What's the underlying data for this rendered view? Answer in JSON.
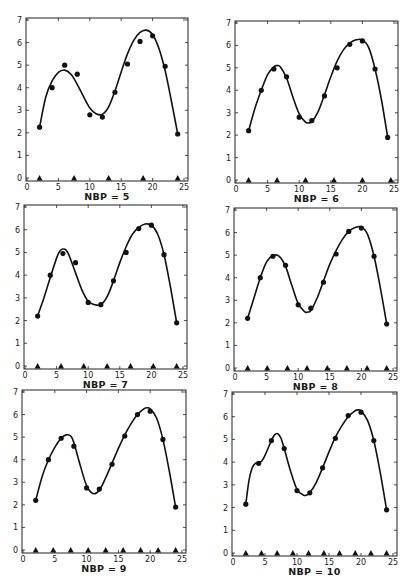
{
  "figure": {
    "background": "#ffffff",
    "ink": "#111111"
  },
  "chart_data": [
    {
      "type": "scatter",
      "title": "NBP = 5",
      "xlabel": "",
      "ylabel": "",
      "xlim": [
        0,
        25
      ],
      "ylim": [
        0,
        7
      ],
      "xticks": [
        0,
        5,
        10,
        15,
        20,
        25
      ],
      "yticks": [
        0,
        1,
        2,
        3,
        4,
        5,
        6,
        7
      ],
      "grid": false,
      "points": {
        "x": [
          2,
          4,
          6,
          8,
          10,
          12,
          14,
          16,
          18,
          20,
          22,
          24
        ],
        "y": [
          2.25,
          4.0,
          5.0,
          4.6,
          2.8,
          2.7,
          3.8,
          5.05,
          6.05,
          6.3,
          4.95,
          1.95
        ]
      },
      "fit_curve": {
        "x": [
          2,
          3,
          4,
          5,
          6,
          7,
          8,
          9,
          10,
          11,
          12,
          13,
          14,
          15,
          16,
          17,
          18,
          19,
          20,
          21,
          22,
          23,
          24
        ],
        "y": [
          2.25,
          3.6,
          4.3,
          4.68,
          4.78,
          4.6,
          4.15,
          3.6,
          3.1,
          2.85,
          2.82,
          3.15,
          3.85,
          4.7,
          5.5,
          6.1,
          6.45,
          6.55,
          6.35,
          5.75,
          4.75,
          3.4,
          1.95
        ]
      },
      "breakpoints_x": [
        2,
        7.5,
        13,
        18.5,
        24
      ]
    },
    {
      "type": "scatter",
      "title": "NBP = 6",
      "xlabel": "",
      "ylabel": "",
      "xlim": [
        0,
        25
      ],
      "ylim": [
        0,
        7
      ],
      "xticks": [
        0,
        5,
        10,
        15,
        20,
        25
      ],
      "yticks": [
        0,
        1,
        2,
        3,
        4,
        5,
        6,
        7
      ],
      "grid": false,
      "points": {
        "x": [
          2,
          4,
          6,
          8,
          10,
          12,
          14,
          16,
          18,
          20,
          22,
          24
        ],
        "y": [
          2.2,
          4.0,
          4.95,
          4.6,
          2.8,
          2.65,
          3.75,
          5.0,
          6.05,
          6.2,
          4.95,
          1.9
        ]
      },
      "fit_curve": {
        "x": [
          2,
          3,
          4,
          5,
          6,
          6.5,
          7,
          8,
          9,
          10,
          11,
          11.5,
          12,
          13,
          14,
          15,
          16,
          17,
          18,
          19,
          20,
          21,
          22,
          23,
          24
        ],
        "y": [
          2.2,
          3.2,
          4.0,
          4.7,
          5.05,
          5.1,
          5.05,
          4.55,
          3.7,
          2.95,
          2.58,
          2.55,
          2.6,
          3.05,
          3.8,
          4.6,
          5.3,
          5.8,
          6.1,
          6.25,
          6.25,
          5.9,
          4.95,
          3.6,
          1.9
        ]
      },
      "breakpoints_x": [
        2,
        6.5,
        11,
        15.5,
        20,
        24.5
      ]
    },
    {
      "type": "scatter",
      "title": "NBP = 7",
      "xlabel": "",
      "ylabel": "",
      "xlim": [
        0,
        25
      ],
      "ylim": [
        0,
        7
      ],
      "xticks": [
        0,
        5,
        10,
        15,
        20,
        25
      ],
      "yticks": [
        0,
        1,
        2,
        3,
        4,
        5,
        6,
        7
      ],
      "grid": false,
      "points": {
        "x": [
          2,
          4,
          6,
          8,
          10,
          12,
          14,
          16,
          18,
          20,
          22,
          24
        ],
        "y": [
          2.2,
          4.0,
          4.95,
          4.55,
          2.8,
          2.7,
          3.75,
          5.0,
          6.05,
          6.2,
          4.9,
          1.9
        ]
      },
      "fit_curve": {
        "x": [
          2,
          3,
          4,
          5,
          5.5,
          6,
          6.5,
          7,
          8,
          9,
          10,
          11,
          12,
          13,
          14,
          15,
          16,
          17,
          18,
          19,
          20,
          21,
          22,
          23,
          24
        ],
        "y": [
          2.2,
          3.0,
          3.9,
          4.75,
          5.05,
          5.15,
          5.1,
          4.85,
          4.1,
          3.35,
          2.85,
          2.7,
          2.7,
          3.05,
          3.75,
          4.55,
          5.25,
          5.8,
          6.1,
          6.25,
          6.2,
          5.8,
          4.9,
          3.5,
          1.9
        ]
      },
      "breakpoints_x": [
        2,
        5.7,
        9.3,
        13,
        16.7,
        20.3,
        24
      ]
    },
    {
      "type": "scatter",
      "title": "NBP = 8",
      "xlabel": "",
      "ylabel": "",
      "xlim": [
        0,
        25
      ],
      "ylim": [
        0,
        7
      ],
      "xticks": [
        0,
        5,
        10,
        15,
        20,
        25
      ],
      "yticks": [
        0,
        1,
        2,
        3,
        4,
        5,
        6,
        7
      ],
      "grid": false,
      "points": {
        "x": [
          2,
          4,
          6,
          8,
          10,
          12,
          14,
          16,
          18,
          20,
          22,
          24
        ],
        "y": [
          2.2,
          4.0,
          4.95,
          4.55,
          2.8,
          2.65,
          3.8,
          5.05,
          6.05,
          6.2,
          4.95,
          1.95
        ]
      },
      "fit_curve": {
        "x": [
          2,
          3,
          4,
          5,
          6,
          7,
          8,
          9,
          10,
          11,
          11.5,
          12,
          13,
          14,
          15,
          16,
          17,
          18,
          19,
          20,
          21,
          22,
          23,
          24
        ],
        "y": [
          2.2,
          3.1,
          4.0,
          4.7,
          4.98,
          4.95,
          4.5,
          3.65,
          2.85,
          2.5,
          2.48,
          2.55,
          3.1,
          3.85,
          4.6,
          5.2,
          5.7,
          6.05,
          6.22,
          6.25,
          5.9,
          4.95,
          3.55,
          1.95
        ]
      },
      "breakpoints_x": [
        2,
        5.1,
        8.3,
        11.4,
        14.6,
        17.7,
        20.9,
        24
      ]
    },
    {
      "type": "scatter",
      "title": "NBP = 9",
      "xlabel": "",
      "ylabel": "",
      "xlim": [
        0,
        25
      ],
      "ylim": [
        0,
        7
      ],
      "xticks": [
        0,
        5,
        10,
        15,
        20,
        25
      ],
      "yticks": [
        0,
        1,
        2,
        3,
        4,
        5,
        6,
        7
      ],
      "grid": false,
      "points": {
        "x": [
          2,
          4,
          6,
          8,
          10,
          12,
          14,
          16,
          18,
          20,
          22,
          24
        ],
        "y": [
          2.2,
          4.0,
          4.95,
          4.6,
          2.75,
          2.7,
          3.8,
          5.05,
          6.0,
          6.15,
          4.9,
          1.9
        ]
      },
      "fit_curve": {
        "x": [
          2,
          3,
          4,
          5,
          6,
          6.8,
          7.5,
          8,
          9,
          10,
          11,
          12,
          13,
          14,
          15,
          16,
          17,
          18,
          19,
          19.5,
          20,
          21,
          22,
          23,
          24
        ],
        "y": [
          2.2,
          3.25,
          4.0,
          4.55,
          4.95,
          5.1,
          5.05,
          4.75,
          3.75,
          2.85,
          2.5,
          2.65,
          3.2,
          3.85,
          4.5,
          5.1,
          5.6,
          6.0,
          6.25,
          6.3,
          6.25,
          5.85,
          4.9,
          3.5,
          1.9
        ]
      },
      "breakpoints_x": [
        2,
        4.75,
        7.5,
        10.25,
        13,
        15.75,
        18.5,
        21.25,
        24
      ]
    },
    {
      "type": "scatter",
      "title": "NBP = 10",
      "xlabel": "",
      "ylabel": "",
      "xlim": [
        0,
        25
      ],
      "ylim": [
        0,
        7
      ],
      "xticks": [
        0,
        5,
        10,
        15,
        20,
        25
      ],
      "yticks": [
        0,
        1,
        2,
        3,
        4,
        5,
        6,
        7
      ],
      "grid": false,
      "points": {
        "x": [
          2,
          4,
          6,
          8,
          10,
          12,
          14,
          16,
          18,
          20,
          22,
          24
        ],
        "y": [
          2.15,
          3.95,
          4.95,
          4.6,
          2.75,
          2.65,
          3.75,
          5.05,
          6.05,
          6.2,
          4.95,
          1.9
        ]
      },
      "fit_curve": {
        "x": [
          2,
          2.5,
          3,
          3.5,
          4,
          4.5,
          5,
          6,
          6.5,
          7,
          7.5,
          8,
          9,
          10,
          11,
          11.5,
          12,
          13,
          14,
          15,
          16,
          17,
          18,
          19,
          19.5,
          20,
          21,
          22,
          23,
          24
        ],
        "y": [
          2.15,
          3.2,
          3.75,
          3.95,
          3.98,
          4.05,
          4.3,
          4.95,
          5.2,
          5.25,
          5.05,
          4.6,
          3.6,
          2.8,
          2.55,
          2.55,
          2.65,
          3.1,
          3.75,
          4.45,
          5.1,
          5.6,
          6.0,
          6.25,
          6.3,
          6.25,
          5.85,
          4.95,
          3.55,
          1.9
        ]
      },
      "breakpoints_x": [
        2,
        4.45,
        6.9,
        9.35,
        11.8,
        14.2,
        16.65,
        19.1,
        21.55,
        24
      ]
    }
  ]
}
